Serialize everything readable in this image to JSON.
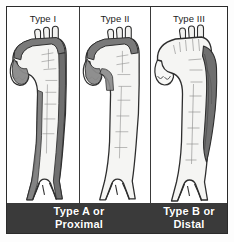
{
  "figure": {
    "panels": [
      {
        "id": "type-1",
        "label": "Type I",
        "dissection_extent": "ascending aorta, arch and descending aorta",
        "shading_regions": [
          "ascending",
          "arch",
          "descending"
        ]
      },
      {
        "id": "type-2",
        "label": "Type II",
        "dissection_extent": "ascending aorta and arch only",
        "shading_regions": [
          "ascending",
          "arch"
        ]
      },
      {
        "id": "type-3",
        "label": "Type III",
        "dissection_extent": "descending aorta only, distal to left subclavian artery",
        "shading_regions": [
          "descending"
        ]
      }
    ],
    "banner": {
      "left": {
        "line1": "Type A or",
        "line2": "Proximal"
      },
      "right": {
        "line1": "Type B or",
        "line2": "Distal"
      }
    },
    "colors": {
      "frame_border": "#2b2b2b",
      "divider": "#3a3a3a",
      "banner_background": "#3a3a3a",
      "banner_text": "#ffffff",
      "vessel_outline": "#2e2e2e",
      "vessel_lumen": "#f4f4f2",
      "dissection_shading": "#7c7c7c",
      "dissection_shading_dark": "#5f5f5f"
    }
  }
}
